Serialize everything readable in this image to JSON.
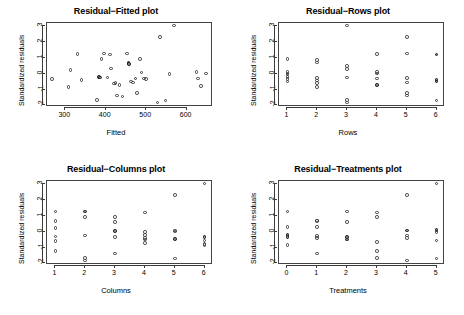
{
  "figure": {
    "background": "#ffffff",
    "point_color": "#3a3a3a",
    "axis_color": "#3a3a3a",
    "layout": "2x2 grid of residual diagnostic scatter plots"
  },
  "chart_data": [
    {
      "type": "scatter",
      "title": "Residual−Fitted plot",
      "xlabel": "Fitted",
      "ylabel": "Standardized residuals",
      "xticks": [
        300,
        400,
        500,
        600
      ],
      "yticks": [
        -2,
        -1,
        0,
        1,
        2,
        3
      ],
      "xlim": [
        255,
        665
      ],
      "ylim": [
        -2.1,
        3.2
      ],
      "grid": false,
      "legend": "none",
      "points": [
        {
          "x": 268,
          "y": -0.33
        },
        {
          "x": 308,
          "y": -0.85
        },
        {
          "x": 313,
          "y": 0.25
        },
        {
          "x": 330,
          "y": 1.23
        },
        {
          "x": 340,
          "y": -0.38
        },
        {
          "x": 378,
          "y": -1.65
        },
        {
          "x": 383,
          "y": -0.22,
          "dark": true
        },
        {
          "x": 386,
          "y": -0.24,
          "dark": true
        },
        {
          "x": 390,
          "y": 0.93
        },
        {
          "x": 396,
          "y": 1.28
        },
        {
          "x": 404,
          "y": -0.25
        },
        {
          "x": 410,
          "y": 1.22
        },
        {
          "x": 413,
          "y": 0.33
        },
        {
          "x": 421,
          "y": -0.61
        },
        {
          "x": 424,
          "y": -0.6
        },
        {
          "x": 428,
          "y": -1.38
        },
        {
          "x": 434,
          "y": -0.72
        },
        {
          "x": 441,
          "y": -1.45
        },
        {
          "x": 452,
          "y": 1.28
        },
        {
          "x": 456,
          "y": 0.68,
          "dark": true
        },
        {
          "x": 458,
          "y": 0.62,
          "dark": true
        },
        {
          "x": 462,
          "y": -0.5
        },
        {
          "x": 468,
          "y": -0.56
        },
        {
          "x": 474,
          "y": -0.3
        },
        {
          "x": 478,
          "y": -1.22
        },
        {
          "x": 484,
          "y": 0.92
        },
        {
          "x": 488,
          "y": 0.08
        },
        {
          "x": 494,
          "y": -0.3
        },
        {
          "x": 500,
          "y": -0.34
        },
        {
          "x": 528,
          "y": -1.82
        },
        {
          "x": 534,
          "y": 2.3
        },
        {
          "x": 548,
          "y": -1.7
        },
        {
          "x": 558,
          "y": -0.02
        },
        {
          "x": 569,
          "y": 3.05
        },
        {
          "x": 624,
          "y": 0.12
        },
        {
          "x": 628,
          "y": -0.3
        },
        {
          "x": 636,
          "y": -0.78
        },
        {
          "x": 648,
          "y": 0.02
        }
      ]
    },
    {
      "type": "scatter",
      "title": "Residual−Rows plot",
      "xlabel": "Rows",
      "ylabel": "Standardized residuals",
      "xticks": [
        1,
        2,
        3,
        4,
        5,
        6
      ],
      "yticks": [
        -2,
        -1,
        0,
        1,
        2,
        3
      ],
      "xlim": [
        0.72,
        6.28
      ],
      "ylim": [
        -2.1,
        3.2
      ],
      "grid": false,
      "legend": "none",
      "points": [
        {
          "x": 1,
          "y": 0.93
        },
        {
          "x": 1,
          "y": 0.1
        },
        {
          "x": 1,
          "y": 0.02
        },
        {
          "x": 1,
          "y": -0.06
        },
        {
          "x": 1,
          "y": -0.22
        },
        {
          "x": 1,
          "y": -0.33
        },
        {
          "x": 1,
          "y": -0.48
        },
        {
          "x": 2,
          "y": 0.88
        },
        {
          "x": 2,
          "y": 0.7
        },
        {
          "x": 2,
          "y": -0.26
        },
        {
          "x": 2,
          "y": -0.42
        },
        {
          "x": 2,
          "y": -0.6
        },
        {
          "x": 2,
          "y": -0.85
        },
        {
          "x": 3,
          "y": 3.05
        },
        {
          "x": 3,
          "y": 0.48
        },
        {
          "x": 3,
          "y": 0.28
        },
        {
          "x": 3,
          "y": -0.25
        },
        {
          "x": 3,
          "y": -1.65
        },
        {
          "x": 3,
          "y": -1.82
        },
        {
          "x": 4,
          "y": 1.25
        },
        {
          "x": 4,
          "y": 0.12
        },
        {
          "x": 4,
          "y": 0.02
        },
        {
          "x": 4,
          "y": -0.3
        },
        {
          "x": 4,
          "y": -0.72,
          "dark": true
        },
        {
          "x": 5,
          "y": 2.3
        },
        {
          "x": 5,
          "y": 1.28
        },
        {
          "x": 5,
          "y": -0.28
        },
        {
          "x": 5,
          "y": -0.56
        },
        {
          "x": 5,
          "y": -1.2
        },
        {
          "x": 5,
          "y": -1.38
        },
        {
          "x": 6,
          "y": 1.22,
          "dark": true
        },
        {
          "x": 6,
          "y": -0.38,
          "dark": true
        },
        {
          "x": 6,
          "y": -0.5,
          "dark": true
        },
        {
          "x": 6,
          "y": -1.7
        }
      ]
    },
    {
      "type": "scatter",
      "title": "Residual−Columns plot",
      "xlabel": "Columns",
      "ylabel": "Standardized residuals",
      "xticks": [
        1,
        2,
        3,
        4,
        5,
        6
      ],
      "yticks": [
        -2,
        -1,
        0,
        1,
        2,
        3
      ],
      "xlim": [
        0.72,
        6.28
      ],
      "ylim": [
        -2.1,
        3.2
      ],
      "grid": false,
      "legend": "none",
      "points": [
        {
          "x": 1,
          "y": 1.28
        },
        {
          "x": 1,
          "y": 0.68
        },
        {
          "x": 1,
          "y": 0.25
        },
        {
          "x": 1,
          "y": -0.3
        },
        {
          "x": 1,
          "y": -0.6
        },
        {
          "x": 1,
          "y": -1.22
        },
        {
          "x": 2,
          "y": 1.28,
          "dark": true
        },
        {
          "x": 2,
          "y": 0.92
        },
        {
          "x": 2,
          "y": -0.25
        },
        {
          "x": 2,
          "y": -1.65
        },
        {
          "x": 2,
          "y": -1.82
        },
        {
          "x": 3,
          "y": 0.93
        },
        {
          "x": 3,
          "y": 0.6
        },
        {
          "x": 3,
          "y": 0.06,
          "dark": true
        },
        {
          "x": 3,
          "y": -0.33
        },
        {
          "x": 3,
          "y": -1.38
        },
        {
          "x": 4,
          "y": 1.22
        },
        {
          "x": 4,
          "y": -0.02
        },
        {
          "x": 4,
          "y": -0.22
        },
        {
          "x": 4,
          "y": -0.38
        },
        {
          "x": 4,
          "y": -0.5
        },
        {
          "x": 4,
          "y": -0.72
        },
        {
          "x": 5,
          "y": 2.3
        },
        {
          "x": 5,
          "y": 0.08
        },
        {
          "x": 5,
          "y": 0.02
        },
        {
          "x": 5,
          "y": -0.45,
          "dark": true
        },
        {
          "x": 5,
          "y": -1.7
        },
        {
          "x": 6,
          "y": 3.05
        },
        {
          "x": 6,
          "y": -0.34,
          "dark": true
        },
        {
          "x": 6,
          "y": -0.56
        },
        {
          "x": 6,
          "y": -0.78
        },
        {
          "x": 6,
          "y": -0.85
        }
      ]
    },
    {
      "type": "scatter",
      "title": "Residual−Treatments plot",
      "xlabel": "Treatments",
      "ylabel": "Standardized residuals",
      "xticks": [
        0,
        1,
        2,
        3,
        4,
        5
      ],
      "yticks": [
        -2,
        -1,
        0,
        1,
        2,
        3
      ],
      "xlim": [
        -0.28,
        5.28
      ],
      "ylim": [
        -2.1,
        3.2
      ],
      "grid": false,
      "legend": "none",
      "points": [
        {
          "x": 0,
          "y": 1.28
        },
        {
          "x": 0,
          "y": 0.3
        },
        {
          "x": 0,
          "y": -0.22,
          "dark": true
        },
        {
          "x": 0,
          "y": -0.32,
          "dark": true
        },
        {
          "x": 0,
          "y": -0.85
        },
        {
          "x": 1,
          "y": 0.72
        },
        {
          "x": 1,
          "y": 0.68
        },
        {
          "x": 1,
          "y": 0.3
        },
        {
          "x": 1,
          "y": -0.28
        },
        {
          "x": 1,
          "y": -0.4
        },
        {
          "x": 1,
          "y": -1.38
        },
        {
          "x": 2,
          "y": 1.28
        },
        {
          "x": 2,
          "y": 0.6
        },
        {
          "x": 2,
          "y": -0.33,
          "dark": true
        },
        {
          "x": 2,
          "y": -0.48,
          "dark": true
        },
        {
          "x": 3,
          "y": 1.22
        },
        {
          "x": 3,
          "y": 0.93
        },
        {
          "x": 3,
          "y": -0.65
        },
        {
          "x": 3,
          "y": -1.22
        },
        {
          "x": 3,
          "y": -1.65
        },
        {
          "x": 4,
          "y": 2.3
        },
        {
          "x": 4,
          "y": 0.08,
          "dark": true
        },
        {
          "x": 4,
          "y": -0.25
        },
        {
          "x": 4,
          "y": -0.38
        },
        {
          "x": 4,
          "y": -1.82
        },
        {
          "x": 5,
          "y": 3.05
        },
        {
          "x": 5,
          "y": 0.1,
          "dark": true
        },
        {
          "x": 5,
          "y": -0.02
        },
        {
          "x": 5,
          "y": -0.56
        },
        {
          "x": 5,
          "y": -1.7
        }
      ]
    }
  ]
}
